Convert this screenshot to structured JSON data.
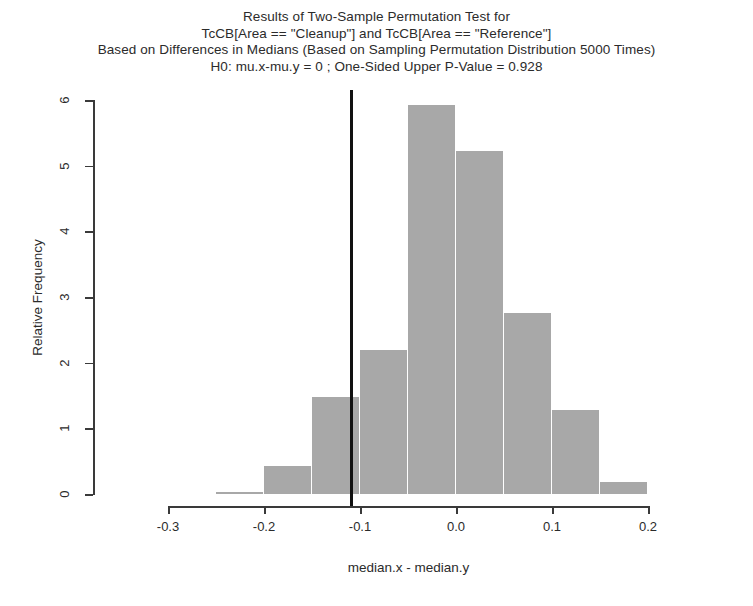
{
  "title": {
    "line1": "Results of Two-Sample Permutation Test for",
    "line2": "TcCB[Area == \"Cleanup\"] and TcCB[Area == \"Reference\"]",
    "line3": "Based on Differences in Medians (Based on Sampling Permutation Distribution 5000 Times)",
    "line4": "H0: mu.x-mu.y = 0 ;  One-Sided Upper P-Value = 0.928"
  },
  "axes": {
    "ylabel": "Relative Frequency",
    "xlabel": "median.x - median.y",
    "yticks": [
      "0",
      "1",
      "2",
      "3",
      "4",
      "5",
      "6"
    ],
    "xticks": [
      "-0.3",
      "-0.2",
      "-0.1",
      "0.0",
      "0.1",
      "0.2"
    ]
  },
  "chart_data": {
    "type": "bar",
    "title": "Results of Two-Sample Permutation Test for TcCB[Area == \"Cleanup\"] and TcCB[Area == \"Reference\"] Based on Differences in Medians (Based on Sampling Permutation Distribution 5000 Times)",
    "subtitle": "H0: mu.x-mu.y = 0 ;  One-Sided Upper P-Value = 0.928",
    "xlabel": "median.x - median.y",
    "ylabel": "Relative Frequency",
    "xlim": [
      -0.3,
      0.2
    ],
    "ylim": [
      0,
      6
    ],
    "grid": false,
    "legend": "none",
    "bin_width": 0.05,
    "bin_edges": [
      -0.25,
      -0.2,
      -0.15,
      -0.1,
      -0.05,
      0.0,
      0.05,
      0.1,
      0.15,
      0.2
    ],
    "categories": [
      "-0.25 to -0.20",
      "-0.20 to -0.15",
      "-0.15 to -0.10",
      "-0.10 to -0.05",
      "-0.05 to 0.00",
      "0.00 to 0.05",
      "0.05 to 0.10",
      "0.10 to 0.15",
      "0.15 to 0.20"
    ],
    "values": [
      0.03,
      0.42,
      1.48,
      2.2,
      5.92,
      5.22,
      2.75,
      1.28,
      0.18
    ],
    "bar_color": "#a8a8a8",
    "annotations": [
      {
        "name": "observed-statistic-line",
        "type": "vline",
        "x": -0.11,
        "color": "#111111",
        "label": "Observed difference in medians"
      }
    ],
    "p_value": 0.928,
    "n_permutations": 5000
  },
  "colors": {
    "bar": "#a8a8a8",
    "axis": "#3a3a3a",
    "reference_line": "#111111",
    "text": "#2b2b2b",
    "background": "#ffffff"
  }
}
